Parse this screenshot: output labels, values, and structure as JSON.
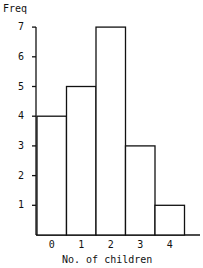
{
  "chart_data": {
    "type": "bar",
    "title": "",
    "xlabel": "No. of children",
    "ylabel": "Freq",
    "categories": [
      "0",
      "1",
      "2",
      "3",
      "4"
    ],
    "values": [
      4,
      5,
      7,
      3,
      1
    ],
    "yticks": [
      "1",
      "2",
      "3",
      "4",
      "5",
      "6",
      "7"
    ],
    "ylim": [
      0,
      7
    ],
    "grid": false,
    "legend": null
  }
}
